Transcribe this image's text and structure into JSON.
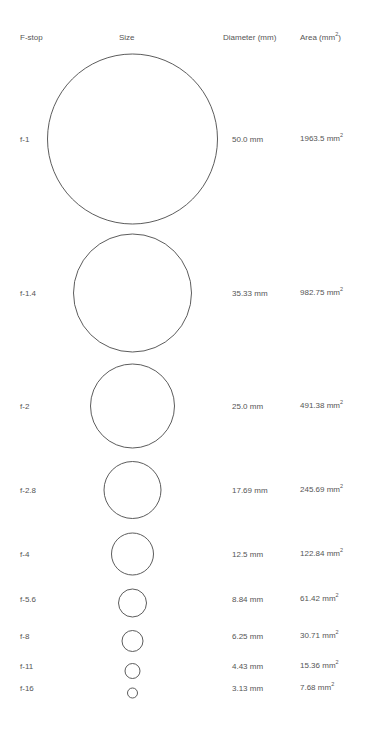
{
  "headers": {
    "fstop": "F-stop",
    "size": "Size",
    "diameter": "Diameter (mm)",
    "area_prefix": "Area (mm",
    "area_sup": "2",
    "area_suffix": ")"
  },
  "rows": [
    {
      "fstop": "f-1",
      "diameter": "50.0 mm",
      "area": "1963.5 mm",
      "sup": "2",
      "cy": 139,
      "r": 85
    },
    {
      "fstop": "f-1.4",
      "diameter": "35.33 mm",
      "area": "982.75 mm",
      "sup": "2",
      "cy": 293,
      "r": 59
    },
    {
      "fstop": "f-2",
      "diameter": "25.0 mm",
      "area": "491.38 mm",
      "sup": "2",
      "cy": 406,
      "r": 42
    },
    {
      "fstop": "f-2.8",
      "diameter": "17.69 mm",
      "area": "245.69 mm",
      "sup": "2",
      "cy": 490,
      "r": 28.5
    },
    {
      "fstop": "f-4",
      "diameter": "12.5 mm",
      "area": "122.84 mm",
      "sup": "2",
      "cy": 554,
      "r": 21
    },
    {
      "fstop": "f-5.6",
      "diameter": "8.84 mm",
      "area": "61.42 mm",
      "sup": "2",
      "cy": 603,
      "r": 14
    },
    {
      "fstop": "f-8",
      "diameter": "6.25 mm",
      "area": "30.71 mm",
      "sup": "2",
      "cy": 641,
      "r": 10.5
    },
    {
      "fstop": "f-11",
      "diameter": "4.43 mm",
      "area": "15.36 mm",
      "sup": "2",
      "cy": 671,
      "r": 7.5
    },
    {
      "fstop": "f-16",
      "diameter": "3.13 mm",
      "area": "7.68 mm",
      "sup": "2",
      "cy": 693,
      "r": 5
    }
  ],
  "text_rows_y": [
    139,
    293,
    406,
    490,
    554,
    599,
    636,
    666,
    688
  ],
  "colors": {
    "stroke": "#4a4a4a",
    "text": "#555555",
    "background": "#ffffff"
  }
}
